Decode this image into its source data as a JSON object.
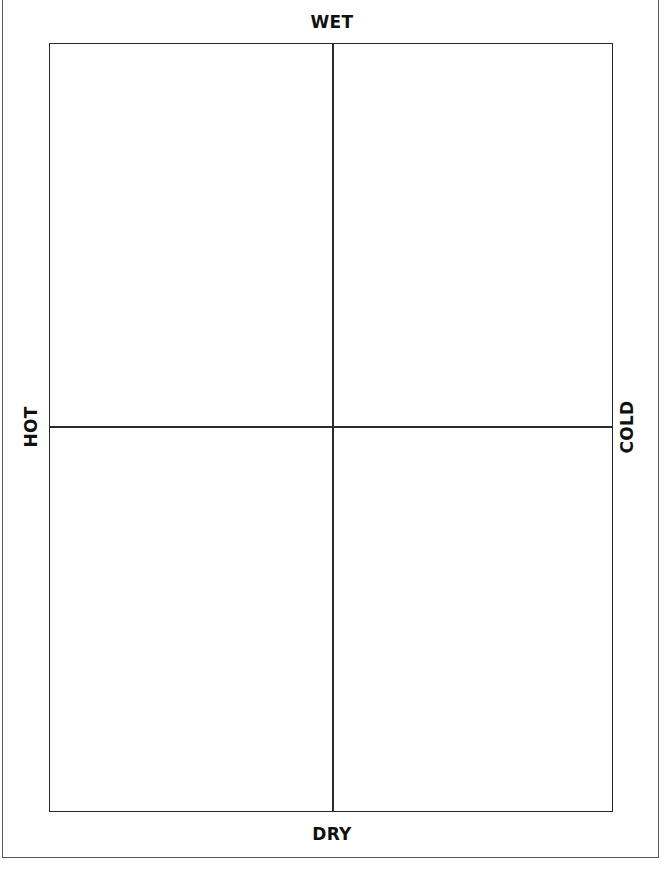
{
  "diagram": {
    "type": "four-quadrant-grid",
    "axis_labels": {
      "top": "WET",
      "bottom": "DRY",
      "left": "HOT",
      "right": "COLD"
    },
    "quadrants": [
      {
        "position": "top-left",
        "content": ""
      },
      {
        "position": "top-right",
        "content": ""
      },
      {
        "position": "bottom-left",
        "content": ""
      },
      {
        "position": "bottom-right",
        "content": ""
      }
    ],
    "colors": {
      "lines": "#2a2a2a",
      "text": "#111111",
      "background": "#ffffff"
    }
  }
}
